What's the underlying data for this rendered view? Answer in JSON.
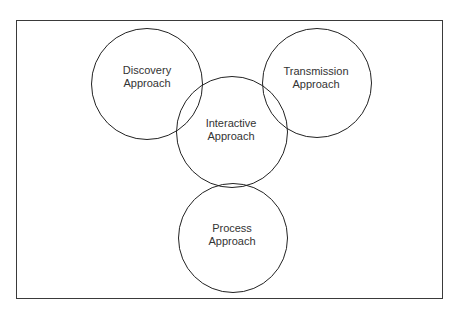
{
  "diagram": {
    "type": "venn",
    "circles": [
      {
        "id": "discovery",
        "line1": "Discovery",
        "line2": "Approach",
        "cx": 147,
        "cy": 84,
        "r": 56
      },
      {
        "id": "transmission",
        "line1": "Transmission",
        "line2": "Approach",
        "cx": 317,
        "cy": 83,
        "r": 55
      },
      {
        "id": "interactive",
        "line1": "Interactive",
        "line2": "Approach",
        "cx": 232,
        "cy": 132,
        "r": 56
      },
      {
        "id": "process",
        "line1": "Process",
        "line2": "Approach",
        "cx": 233,
        "cy": 238,
        "r": 55
      }
    ],
    "colors": {
      "stroke": "#222222",
      "text": "#333333",
      "frame": "#3a3a3a",
      "background": "#ffffff"
    }
  }
}
